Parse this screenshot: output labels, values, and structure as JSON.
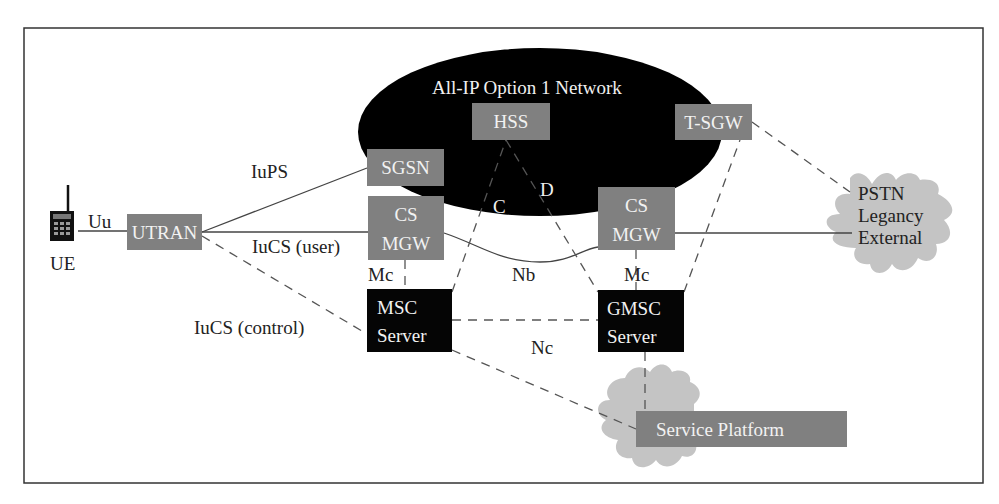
{
  "network": {
    "title": "All-IP  Option 1 Network"
  },
  "nodes": {
    "ue": "UE",
    "utran": "UTRAN",
    "sgsn": "SGSN",
    "cs_mgw_left": [
      "CS",
      "MGW"
    ],
    "hss": "HSS",
    "t_sgw": "T-SGW",
    "cs_mgw_right": [
      "CS",
      "MGW"
    ],
    "msc_server": [
      "MSC",
      "Server"
    ],
    "gmsc_server": [
      "GMSC",
      "Server"
    ],
    "service_platform": "Service Platform",
    "pstn": [
      "PSTN",
      "Legancy",
      "External"
    ]
  },
  "interfaces": {
    "uu": "Uu",
    "iups": "IuPS",
    "iucs_user": "IuCS (user)",
    "iucs_control": "IuCS (control)",
    "mc_left": "Mc",
    "mc_right": "Mc",
    "nb": "Nb",
    "nc": "Nc",
    "c": "C",
    "d": "D"
  },
  "colors": {
    "frame": "#333333",
    "ellipse": "#000000",
    "gray_box": "#808080",
    "black_box": "#050505",
    "cloud": "#c4c4c4",
    "line": "#444444",
    "dashed": "#555555"
  }
}
